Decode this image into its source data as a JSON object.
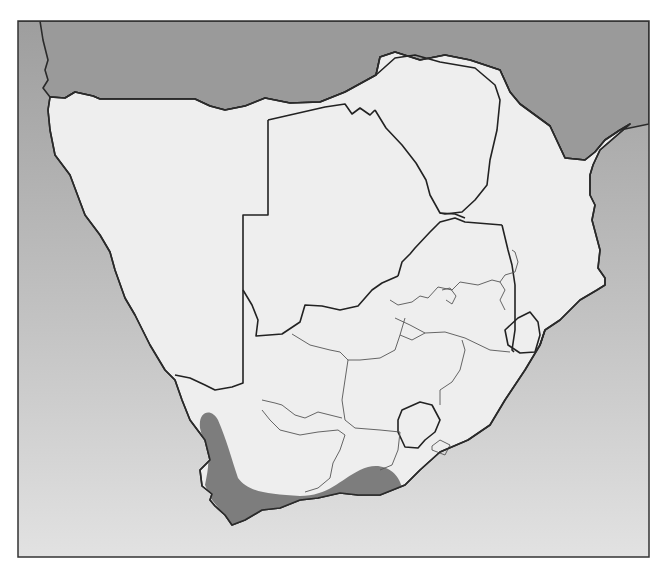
{
  "map": {
    "width": 666,
    "height": 574,
    "frame": {
      "x": 18,
      "y": 21,
      "w": 631,
      "h": 536
    },
    "colors": {
      "ocean_top": "#9e9e9e",
      "ocean_mid": "#c2c2c2",
      "ocean_bottom": "#e2e2e2",
      "focus_land": "#eeeeee",
      "other_land": "#9a9a9a",
      "range_fill": "#7d7d7d",
      "border": "#2a2a2a",
      "frame": "#333333"
    },
    "region_label": "Southern Africa",
    "shaded_range": {
      "label": "species distribution range",
      "description": "Western and Southern Cape, extending north along the west coast and east to the Eastern Cape"
    },
    "countries": [
      {
        "name": "Angola",
        "role": "context"
      },
      {
        "name": "Zambia",
        "role": "context"
      },
      {
        "name": "Malawi",
        "role": "context"
      },
      {
        "name": "Namibia",
        "role": "focus"
      },
      {
        "name": "Botswana",
        "role": "focus"
      },
      {
        "name": "Zimbabwe",
        "role": "focus"
      },
      {
        "name": "Mozambique",
        "role": "focus"
      },
      {
        "name": "South Africa",
        "role": "focus"
      },
      {
        "name": "Lesotho",
        "role": "focus"
      },
      {
        "name": "Eswatini",
        "role": "focus"
      }
    ],
    "paths": {
      "northern_land": "M18,21 L649,21 L649,124 L620,130 L605,140 L595,152 L585,160 L565,158 L550,126 L520,104 L510,92 L500,70 L470,60 L445,55 L420,60 L395,52 L380,57 L376,75 L345,92 L320,102 L290,103 L265,98 L248,110 L245,106 L225,110 L210,106 L195,99 L100,99 L93,96 L75,92 L65,98 L50,97 L43,88 L48,80 L45,70 L48,60 L43,40 L40,21 Z",
      "focus_land": "M50,97 L65,98 L75,92 L93,96 L100,99 L195,99 L210,106 L225,110 L245,106 L265,98 L290,103 L320,102 L345,92 L376,75 L380,57 L395,52 L420,60 L445,55 L470,60 L500,70 L510,92 L520,104 L550,126 L565,158 L585,160 L595,152 L605,140 L620,130 L630,124 L600,150 L593,165 L590,175 L590,195 L595,205 L592,220 L600,250 L598,268 L605,278 L605,285 L597,290 L580,300 L560,320 L545,330 L540,345 L525,370 L505,400 L490,425 L468,440 L440,452 L420,470 L405,485 L380,495 L358,495 L340,493 L318,498 L300,500 L280,508 L262,510 L245,520 L232,525 L225,515 L215,506 L210,500 L212,494 L202,486 L200,470 L210,460 L205,440 L190,420 L182,400 L175,380 L165,370 L150,345 L135,315 L125,298 L115,270 L110,252 L100,235 L85,215 L70,175 L55,155 L50,130 L48,110 Z",
      "range": "M200,428 C198,410 212,408 218,420 C226,438 232,460 238,478 C248,492 268,494 300,496 C328,496 340,480 360,470 C380,460 398,470 402,488 C408,505 400,518 390,522 L232,525 L212,500 L205,485 C208,470 210,460 206,452 Z",
      "range_clip_note": "clipped to focus land",
      "namibia_botswana": "M268,120 L325,107 L345,104 L352,114 L360,108 L370,115 L375,110",
      "namibia_east": "M268,120 L268,215 L243,215 L243,383 L232,387 L215,390 L205,385 L190,378 L175,375",
      "botswana_south": "M243,290 L252,305 L258,320 L256,336 L282,334 L300,322 L305,305 L322,306 L340,310 L358,306 L372,290 L382,283 L398,276",
      "botswana_zimbabwe": "M375,110 L386,128 L402,145 L416,163 L426,180 L430,195 L440,213 L455,214 L465,218",
      "zimbabwe_ring": "M376,75 L395,58 L415,55 L440,62 L475,68 L495,85 L500,100 L497,130 L490,160 L487,185 L475,200 L462,212 L445,214 L440,213",
      "sa_north": "M398,276 L402,262 L410,254 L415,248 L430,232 L440,222 L455,218 L465,222 L502,225",
      "sa_moz": "M502,225 L508,250 L512,265 L515,285 L515,300 L515,330 L512,350 L514,352",
      "swaziland": "M518,318 L530,312 L538,322 L540,335 L535,352 L520,353 L508,345 L505,330 Z",
      "lesotho": "M402,410 L420,402 L432,405 L440,420 L435,432 L425,440 L418,448 L405,447 L398,432 L398,420 Z",
      "moz_south_coast": "M545,330 L540,345"
    },
    "province_lines": [
      "M438,287 L452,290 L460,282 L478,285 L492,280 L500,282 L505,290 L500,300 L505,310",
      "M390,300 L398,305 L412,302 L420,296 L428,298 L438,287",
      "M395,318 L410,325 L425,333 L445,332 L465,338 L490,350 L510,352",
      "M405,318 L400,335 L412,340 L425,333",
      "M292,334 L310,345 L330,350 L340,352 L348,360 L360,360 L380,358 L395,350 L400,335",
      "M348,360 L345,380 L342,400 L345,420 L355,428 L380,430 L400,432",
      "M462,340 L465,350 L460,370 L452,382 L440,390 L440,405",
      "M262,400 L275,403 L282,405 L295,415 L305,418 L318,412 L330,415 L342,418",
      "M262,410 L270,420 L280,430 L300,435 L318,432 L338,430 L345,435",
      "M345,435 L340,450 L333,463 L330,478 L318,488 L305,492",
      "M400,432 L398,450 L392,465 L380,470",
      "M432,446 L440,440 L450,445 L445,455 L432,450 Z",
      "M442,290 L450,288 L456,296 L452,304 L446,300",
      "M500,282 L505,275 L515,272 L518,262 L515,252 L512,250"
    ]
  }
}
